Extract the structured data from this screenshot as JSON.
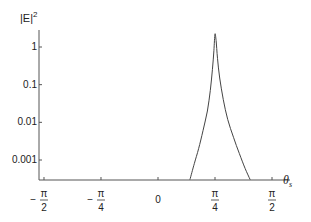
{
  "chart_data": {
    "type": "line",
    "title": "",
    "ylabel": "|E|²",
    "ylabel_main": "|E|",
    "ylabel_sup": "2",
    "xlabel": "θ",
    "xlabel_sub": "s",
    "yscale": "log",
    "ylim": [
      0.0003,
      3
    ],
    "xlim": [
      -1.6,
      1.75
    ],
    "grid": false,
    "legend": "none",
    "y_ticks": [
      {
        "value": 1,
        "label": "1"
      },
      {
        "value": 0.1,
        "label": "0.1"
      },
      {
        "value": 0.01,
        "label": "0.01"
      },
      {
        "value": 0.001,
        "label": "0.001"
      }
    ],
    "x_ticks": [
      {
        "value": -1.5708,
        "sign": "−",
        "num": "π",
        "den": "2",
        "label": "-π/2"
      },
      {
        "value": -0.7854,
        "sign": "−",
        "num": "π",
        "den": "4",
        "label": "-π/4"
      },
      {
        "value": 0,
        "sign": "",
        "num": "",
        "den": "",
        "label": "0"
      },
      {
        "value": 0.7854,
        "sign": "",
        "num": "π",
        "den": "4",
        "label": "π/4"
      },
      {
        "value": 1.5708,
        "sign": "",
        "num": "π",
        "den": "2",
        "label": "π/2"
      }
    ],
    "series": [
      {
        "name": "|E|^2",
        "x": [
          0.44,
          0.5,
          0.56,
          0.62,
          0.68,
          0.72,
          0.75,
          0.77,
          0.785,
          0.8,
          0.82,
          0.85,
          0.9,
          0.96,
          1.04,
          1.12,
          1.2,
          1.27
        ],
        "y": [
          0.0003,
          0.0008,
          0.002,
          0.006,
          0.02,
          0.07,
          0.25,
          0.8,
          2.2,
          1.5,
          0.5,
          0.15,
          0.04,
          0.012,
          0.004,
          0.0015,
          0.0006,
          0.0003
        ]
      }
    ]
  }
}
